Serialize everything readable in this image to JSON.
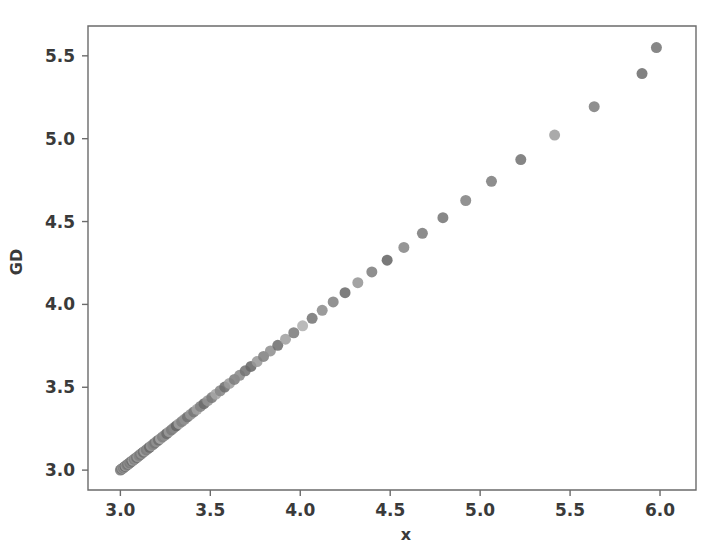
{
  "figure": {
    "background_color": "#ffffff",
    "axes_color": "#6b6b6b",
    "text_color": "#3a3a3a",
    "marker_shape": "circle"
  },
  "chart_data": {
    "type": "scatter",
    "title": "",
    "xlabel": "x",
    "ylabel": "GD",
    "xlim": [
      2.82,
      6.2
    ],
    "ylim": [
      2.88,
      5.68
    ],
    "xticks": [
      3.0,
      3.5,
      4.0,
      4.5,
      5.0,
      5.5,
      6.0
    ],
    "xtick_labels": [
      "3.0",
      "3.5",
      "4.0",
      "4.5",
      "5.0",
      "5.5",
      "6.0"
    ],
    "yticks": [
      3.0,
      3.5,
      4.0,
      4.5,
      5.0,
      5.5
    ],
    "ytick_labels": [
      "3.0",
      "3.5",
      "4.0",
      "4.5",
      "5.0",
      "5.5"
    ],
    "grid": false,
    "legend": null,
    "colormap": "grayscale",
    "marker_size": 11,
    "series": [
      {
        "name": "GD vs x",
        "x": [
          3.0,
          3.004,
          3.008,
          3.012,
          3.017,
          3.021,
          3.026,
          3.031,
          3.036,
          3.041,
          3.047,
          3.052,
          3.058,
          3.064,
          3.07,
          3.077,
          3.083,
          3.09,
          3.097,
          3.104,
          3.112,
          3.119,
          3.127,
          3.136,
          3.144,
          3.153,
          3.162,
          3.171,
          3.181,
          3.191,
          3.201,
          3.212,
          3.223,
          3.234,
          3.246,
          3.258,
          3.271,
          3.284,
          3.297,
          3.311,
          3.326,
          3.341,
          3.357,
          3.373,
          3.39,
          3.408,
          3.426,
          3.445,
          3.465,
          3.486,
          3.508,
          3.531,
          3.555,
          3.58,
          3.606,
          3.634,
          3.663,
          3.694,
          3.726,
          3.76,
          3.796,
          3.834,
          3.875,
          3.918,
          3.964,
          4.013,
          4.066,
          4.122,
          4.183,
          4.249,
          4.32,
          4.398,
          4.483,
          4.576,
          4.679,
          4.793,
          4.92,
          5.063,
          5.226,
          5.414,
          5.634,
          5.9,
          5.98
        ],
        "y": [
          3.0,
          3.003,
          3.007,
          3.01,
          3.014,
          3.018,
          3.022,
          3.026,
          3.03,
          3.035,
          3.039,
          3.044,
          3.049,
          3.054,
          3.059,
          3.065,
          3.07,
          3.076,
          3.082,
          3.088,
          3.095,
          3.101,
          3.108,
          3.115,
          3.122,
          3.13,
          3.138,
          3.146,
          3.154,
          3.163,
          3.172,
          3.181,
          3.19,
          3.2,
          3.21,
          3.221,
          3.232,
          3.243,
          3.255,
          3.267,
          3.28,
          3.293,
          3.307,
          3.321,
          3.336,
          3.351,
          3.367,
          3.384,
          3.401,
          3.419,
          3.438,
          3.458,
          3.479,
          3.501,
          3.523,
          3.547,
          3.572,
          3.599,
          3.626,
          3.655,
          3.686,
          3.719,
          3.753,
          3.79,
          3.829,
          3.871,
          3.916,
          3.964,
          4.015,
          4.071,
          4.131,
          4.196,
          4.267,
          4.344,
          4.429,
          4.523,
          4.627,
          4.743,
          4.874,
          5.022,
          5.193,
          5.393,
          5.55
        ],
        "shades": [
          0.45,
          0.52,
          0.38,
          0.6,
          0.44,
          0.55,
          0.35,
          0.62,
          0.47,
          0.4,
          0.58,
          0.43,
          0.5,
          0.36,
          0.64,
          0.46,
          0.54,
          0.39,
          0.61,
          0.48,
          0.42,
          0.57,
          0.37,
          0.63,
          0.45,
          0.51,
          0.34,
          0.59,
          0.49,
          0.41,
          0.56,
          0.38,
          0.65,
          0.47,
          0.53,
          0.36,
          0.6,
          0.44,
          0.5,
          0.33,
          0.62,
          0.46,
          0.55,
          0.39,
          0.58,
          0.42,
          0.64,
          0.48,
          0.35,
          0.57,
          0.43,
          0.66,
          0.5,
          0.37,
          0.61,
          0.45,
          0.52,
          0.4,
          0.34,
          0.59,
          0.47,
          0.55,
          0.38,
          0.63,
          0.44,
          0.72,
          0.41,
          0.53,
          0.48,
          0.36,
          0.58,
          0.46,
          0.33,
          0.5,
          0.44,
          0.42,
          0.48,
          0.45,
          0.4,
          0.62,
          0.46,
          0.38,
          0.41
        ]
      }
    ]
  }
}
